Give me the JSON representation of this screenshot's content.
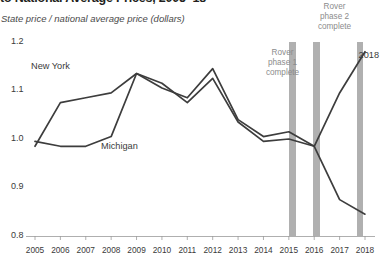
{
  "header": {
    "title": "to National Average Prices, 2005–18",
    "subtitle": "State price / national average price (dollars)"
  },
  "annotations": {
    "phase1": "Rover\nphase 1\ncomplete",
    "phase1_l1": "Rover",
    "phase1_l2": "phase 1",
    "phase1_l3": "complete",
    "phase2_l1": "Rover",
    "phase2_l2": "phase 2",
    "phase2_l3": "complete",
    "end_year": "2018"
  },
  "colors": {
    "line": "#3d3d3d",
    "band": "#b0b0b0",
    "axis": "#9a9a9a",
    "text": "#3a3a3a",
    "annot": "#8c8c8c"
  },
  "chart_data": {
    "type": "line",
    "title": "to National Average Prices, 2005–18",
    "xlabel": "",
    "ylabel": "State price / national average price (dollars)",
    "ylim": [
      0.8,
      1.2
    ],
    "yticks": [
      "0.8",
      "0.9",
      "1.0",
      "1.1",
      "1.2"
    ],
    "ytick_values": [
      0.8,
      0.9,
      1.0,
      1.1,
      1.2
    ],
    "grid": false,
    "legend": "inline-labels",
    "x": [
      2005,
      2006,
      2007,
      2008,
      2009,
      2010,
      2011,
      2012,
      2013,
      2014,
      2015,
      2016,
      2017,
      2018
    ],
    "xticks": [
      "2005",
      "2006",
      "2007",
      "2008",
      "2009",
      "2010",
      "2011",
      "2012",
      "2013",
      "2014",
      "2015",
      "2016",
      "2017",
      "2018"
    ],
    "series": [
      {
        "name": "New York",
        "values": [
          0.985,
          1.075,
          1.085,
          1.095,
          1.135,
          1.105,
          1.085,
          1.145,
          1.04,
          1.005,
          1.015,
          0.985,
          1.095,
          1.18
        ]
      },
      {
        "name": "Michigan",
        "values": [
          0.995,
          0.985,
          0.985,
          1.005,
          1.135,
          1.115,
          1.075,
          1.125,
          1.035,
          0.995,
          1.0,
          0.985,
          0.875,
          0.845
        ]
      }
    ],
    "vertical_bands": [
      {
        "label": "Rover phase 1 complete",
        "x": 2016
      },
      {
        "label": "Rover phase 2 complete",
        "x": 2017
      }
    ]
  }
}
